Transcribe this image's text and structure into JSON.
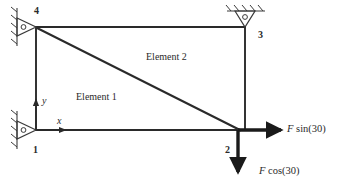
{
  "figure": {
    "type": "truss-free-body-diagram",
    "background_color": "#ffffff",
    "line_color": "#2a2a2a",
    "nodes": [
      {
        "id": "1",
        "label": "1",
        "x": 36,
        "y": 130,
        "support": "roller-vertical-wall-left"
      },
      {
        "id": "2",
        "label": "2",
        "x": 238,
        "y": 130,
        "support": "none"
      },
      {
        "id": "3",
        "label": "3",
        "x": 245,
        "y": 27,
        "support": "roller-horizontal-ground-top"
      },
      {
        "id": "4",
        "label": "4",
        "x": 36,
        "y": 27,
        "support": "roller-vertical-wall-left"
      }
    ],
    "members": [
      {
        "name": "member-4-3-top",
        "from": "4",
        "to": "3"
      },
      {
        "name": "member-1-4-left",
        "from": "1",
        "to": "4"
      },
      {
        "name": "member-1-2-bottom",
        "from": "1",
        "to": "2"
      },
      {
        "name": "member-3-2-right",
        "from": "3",
        "to": "2"
      },
      {
        "name": "member-4-2-diagonal",
        "from": "4",
        "to": "2"
      }
    ],
    "elements": [
      {
        "name": "element-1",
        "label": "Element 1",
        "x": 78,
        "y": 96
      },
      {
        "name": "element-2",
        "label": "Element 2",
        "x": 150,
        "y": 56
      }
    ],
    "axes": {
      "origin_node": "1",
      "x_label": "x",
      "y_label": "y"
    },
    "forces": [
      {
        "name": "force-horizontal",
        "symbol": "F",
        "expression": " sin(30)",
        "full_label": "F sin(30)",
        "direction": "right",
        "applied_at": "2"
      },
      {
        "name": "force-vertical",
        "symbol": "F",
        "expression": " cos(30)",
        "full_label": "F cos(30)",
        "direction": "down",
        "applied_at": "2"
      }
    ],
    "supports": [
      {
        "name": "support-node-4",
        "type": "roller",
        "wall": "vertical-left-hatched"
      },
      {
        "name": "support-node-1",
        "type": "roller",
        "wall": "vertical-left-hatched"
      },
      {
        "name": "support-node-3",
        "type": "roller",
        "wall": "horizontal-top-hatched"
      }
    ]
  }
}
